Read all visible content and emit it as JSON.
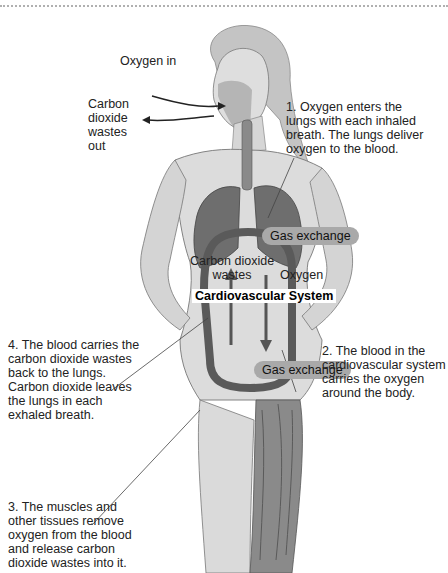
{
  "diagram": {
    "title": "Cardiovascular System",
    "labels": {
      "oxygen_in": "Oxygen in",
      "co2_out": "Carbon\ndioxide\nwastes\nout",
      "gas_exchange_lungs": "Gas exchange",
      "gas_exchange_tissues": "Gas exchange",
      "co2_wastes": "Carbon dioxide\nwastes",
      "oxygen": "Oxygen",
      "cardiovascular_system": "Cardiovascular System"
    },
    "steps": [
      {
        "number": 1,
        "text": "1. Oxygen enters the\nlungs with each inhaled\nbreath. The lungs deliver\noxygen to the blood."
      },
      {
        "number": 2,
        "text": "2. The blood in the\ncardiovascular system\ncarries the oxygen\naround the body."
      },
      {
        "number": 3,
        "text": "3. The muscles and\nother tissues remove\noxygen from the blood\nand release carbon\ndioxide wastes into it."
      },
      {
        "number": 4,
        "text": "4. The blood carries the\ncarbon dioxide wastes\nback to the lungs.\nCarbon dioxide leaves\nthe lungs in each\nexhaled breath."
      }
    ],
    "colors": {
      "skin": "#d9d9d9",
      "lungs": "#6e6e6e",
      "vessel_loop": "#5a5a5a",
      "pill": "#a9a9a9",
      "muscle": "#8a8a8a"
    }
  }
}
